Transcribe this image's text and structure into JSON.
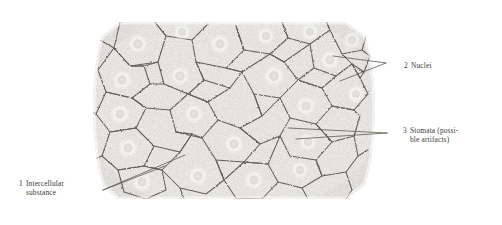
{
  "figure": {
    "kind": "labeled-micrograph",
    "specimen": "squamous epithelium sheet, surface view",
    "plate_tone": "#f4f3f1",
    "wall_color": "#4a4742",
    "leader_color": "#5a564f",
    "text_color": "#3a3a3a",
    "background": "#ffffff"
  },
  "labels": [
    {
      "id": "intercellular",
      "number": "1",
      "line1": "Intercellular",
      "line2": "substance",
      "position": "lower-left"
    },
    {
      "id": "nuclei",
      "number": "2",
      "line1": "Nuclei",
      "line2": "",
      "position": "upper-right"
    },
    {
      "id": "stomata",
      "number": "3",
      "line1": "Stomata (possi-",
      "line2": "ble artifacts)",
      "position": "middle-right"
    }
  ]
}
